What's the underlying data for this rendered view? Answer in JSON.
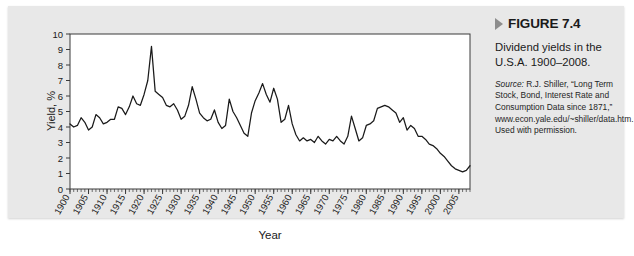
{
  "figure": {
    "arrow_icon": "triangle-right-icon",
    "label": "FIGURE 7.4",
    "caption": "Dividend yields in the U.S.A. 1900–2008.",
    "source_word": "Source:",
    "source_text": " R.J. Shiller, “Long Term Stock, Bond, Interest Rate and Consumption Data since 1871,” www.econ.yale.edu/~shiller/data.htm. Used with permission."
  },
  "chart_data": {
    "type": "line",
    "title": "",
    "xlabel": "Year",
    "ylabel": "Yield, %",
    "xlim": [
      1900,
      2008
    ],
    "ylim": [
      0,
      10
    ],
    "yticks": [
      0,
      1,
      2,
      3,
      4,
      5,
      6,
      7,
      8,
      9,
      10
    ],
    "xticks": [
      1900,
      1905,
      1910,
      1915,
      1920,
      1925,
      1930,
      1935,
      1940,
      1945,
      1950,
      1955,
      1960,
      1965,
      1970,
      1975,
      1980,
      1985,
      1990,
      1995,
      2000,
      2005
    ],
    "xtick_minor_step": 1,
    "grid": false,
    "legend": "none",
    "line_color": "#1a1a1a",
    "plot_background": "#ffffff",
    "panel_background": "#e8e8e8",
    "x": [
      1900,
      1901,
      1902,
      1903,
      1904,
      1905,
      1906,
      1907,
      1908,
      1909,
      1910,
      1911,
      1912,
      1913,
      1914,
      1915,
      1916,
      1917,
      1918,
      1919,
      1920,
      1921,
      1922,
      1923,
      1924,
      1925,
      1926,
      1927,
      1928,
      1929,
      1930,
      1931,
      1932,
      1933,
      1934,
      1935,
      1936,
      1937,
      1938,
      1939,
      1940,
      1941,
      1942,
      1943,
      1944,
      1945,
      1946,
      1947,
      1948,
      1949,
      1950,
      1951,
      1952,
      1953,
      1954,
      1955,
      1956,
      1957,
      1958,
      1959,
      1960,
      1961,
      1962,
      1963,
      1964,
      1965,
      1966,
      1967,
      1968,
      1969,
      1970,
      1971,
      1972,
      1973,
      1974,
      1975,
      1976,
      1977,
      1978,
      1979,
      1980,
      1981,
      1982,
      1983,
      1984,
      1985,
      1986,
      1987,
      1988,
      1989,
      1990,
      1991,
      1992,
      1993,
      1994,
      1995,
      1996,
      1997,
      1998,
      1999,
      2000,
      2001,
      2002,
      2003,
      2004,
      2005,
      2006,
      2007,
      2008
    ],
    "y": [
      4.2,
      4.0,
      4.1,
      4.6,
      4.3,
      3.8,
      4.0,
      4.8,
      4.6,
      4.2,
      4.3,
      4.5,
      4.5,
      5.3,
      5.2,
      4.8,
      5.3,
      6.0,
      5.5,
      5.4,
      6.1,
      7.0,
      9.2,
      6.3,
      6.1,
      5.9,
      5.4,
      5.3,
      5.5,
      5.1,
      4.5,
      4.7,
      5.4,
      6.6,
      5.8,
      4.9,
      4.6,
      4.4,
      4.5,
      5.1,
      4.3,
      3.9,
      4.1,
      5.8,
      5.0,
      4.6,
      4.1,
      3.6,
      3.4,
      4.9,
      5.7,
      6.2,
      6.8,
      6.1,
      5.6,
      6.5,
      5.8,
      4.3,
      4.5,
      5.4,
      4.2,
      3.5,
      3.1,
      3.3,
      3.1,
      3.2,
      3.0,
      3.4,
      3.1,
      2.9,
      3.2,
      3.1,
      3.4,
      3.1,
      2.9,
      3.4,
      4.7,
      3.9,
      3.1,
      3.3,
      4.1,
      4.2,
      4.4,
      5.2,
      5.3,
      5.4,
      5.3,
      5.1,
      4.9,
      4.3,
      4.6,
      3.8,
      4.1,
      3.9,
      3.4,
      3.4,
      3.2,
      2.9,
      2.8,
      2.6,
      2.3,
      2.1,
      1.8,
      1.5,
      1.3,
      1.2,
      1.1,
      1.2,
      1.5,
      1.7,
      1.6,
      1.8,
      1.7,
      2.6,
      1.9,
      3.5
    ]
  }
}
